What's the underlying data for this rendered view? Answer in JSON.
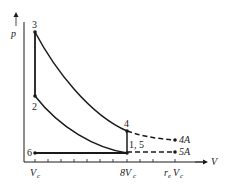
{
  "diagram": {
    "type": "p-V cycle diagram",
    "axes": {
      "y_label": "p",
      "x_label": "V",
      "x_ticks": [
        "V_c",
        "8V_c",
        "r_eV_c"
      ]
    },
    "tick_labels": {
      "vc": "V",
      "vc_sub": "c",
      "eight_vc": "8V",
      "eight_vc_sub": "c",
      "re": "r",
      "re_sub": "e",
      "re_v": "V",
      "re_v_sub": "c"
    },
    "points": {
      "p1": "1, 5",
      "p2": "2",
      "p3": "3",
      "p4": "4",
      "p4a": "4A",
      "p5a": "5A",
      "p6": "6"
    },
    "colors": {
      "line": "#1a1a1a",
      "background": "#ffffff"
    }
  }
}
